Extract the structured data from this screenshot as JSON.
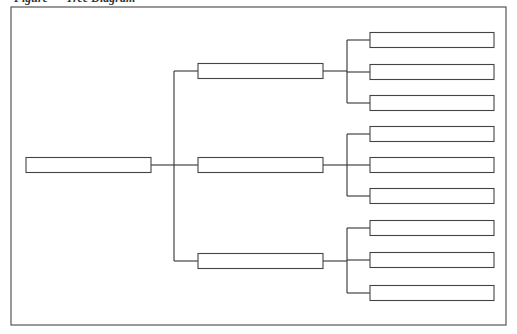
{
  "caption": "Figure — Tree Diagram",
  "tree": {
    "root": {
      "label": ""
    },
    "children": [
      {
        "label": "",
        "children": [
          {
            "label": ""
          },
          {
            "label": ""
          },
          {
            "label": ""
          }
        ]
      },
      {
        "label": "",
        "children": [
          {
            "label": ""
          },
          {
            "label": ""
          },
          {
            "label": ""
          }
        ]
      },
      {
        "label": "",
        "children": [
          {
            "label": ""
          },
          {
            "label": ""
          },
          {
            "label": ""
          }
        ]
      }
    ]
  },
  "colors": {
    "stroke": "#444444",
    "background": "#ffffff"
  }
}
